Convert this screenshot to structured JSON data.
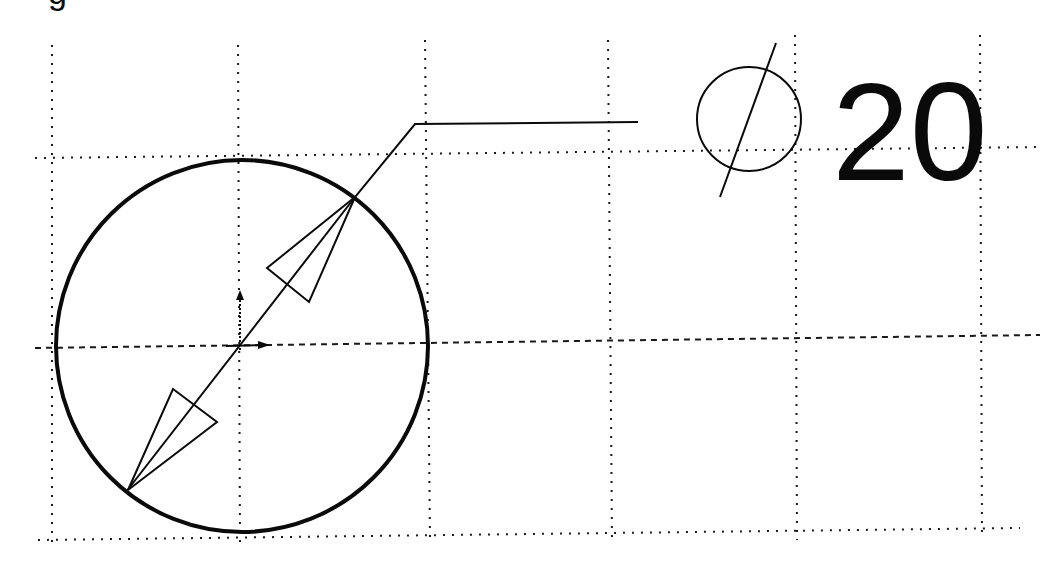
{
  "drawing": {
    "type": "CAD diameter dimension",
    "top_fragment": "g",
    "dimension": {
      "symbol": "⌀",
      "symbol_name": "diameter-symbol",
      "value": "20"
    },
    "colors": {
      "ink": "#0a0a0a",
      "background": "#ffffff"
    },
    "circle": {
      "cx": 242,
      "cy": 346,
      "r": 186
    },
    "grid": {
      "vertical_x": [
        52,
        238,
        428,
        610,
        795,
        980
      ],
      "horizontal_y": [
        158,
        537
      ]
    },
    "center_axis_y": 346
  }
}
